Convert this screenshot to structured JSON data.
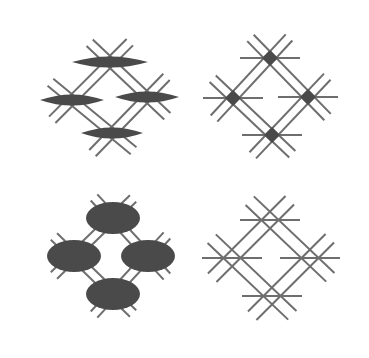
{
  "figure": {
    "width": 369,
    "height": 358,
    "background": "#ffffff",
    "line_color": "#6e6e6e",
    "fill_color": "#4a4a4a",
    "panels": [
      {
        "id": "top-left",
        "node_shape": "horizontal-spindle",
        "offset": [
          0,
          0
        ],
        "nodes": [
          [
            110,
            62
          ],
          [
            72,
            100
          ],
          [
            147,
            97
          ],
          [
            112,
            133
          ]
        ]
      },
      {
        "id": "top-right",
        "node_shape": "small-diamond",
        "offset": [
          0,
          0
        ],
        "nodes": [
          [
            270,
            58
          ],
          [
            233,
            98
          ],
          [
            308,
            97
          ],
          [
            272,
            135
          ]
        ]
      },
      {
        "id": "bottom-left",
        "node_shape": "ellipse",
        "offset": [
          0,
          0
        ],
        "nodes": [
          [
            113,
            218
          ],
          [
            74,
            256
          ],
          [
            148,
            256
          ],
          [
            113,
            294
          ]
        ]
      },
      {
        "id": "bottom-right",
        "node_shape": "none",
        "offset": [
          0,
          0
        ],
        "nodes": [
          [
            270,
            220
          ],
          [
            232,
            258
          ],
          [
            310,
            258
          ],
          [
            272,
            296
          ]
        ]
      }
    ]
  }
}
